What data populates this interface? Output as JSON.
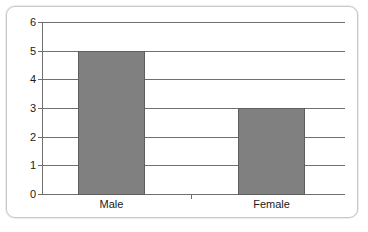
{
  "chart_data": {
    "type": "bar",
    "title": "",
    "subtitle": "",
    "xlabel": "",
    "ylabel": "",
    "categories": [
      "Male",
      "Female"
    ],
    "values": [
      5,
      3
    ],
    "series": [
      {
        "name": "",
        "values": [
          5,
          3
        ]
      }
    ],
    "ylim": [
      0,
      6
    ],
    "ytick_labels": [
      "0",
      "1",
      "2",
      "3",
      "4",
      "5",
      "6"
    ],
    "ytick_values": [
      0,
      1,
      2,
      3,
      4,
      5,
      6
    ],
    "grid": true,
    "legend": false,
    "legend_position": "none",
    "annotations": [],
    "colors": {
      "bar_fill": "#808080",
      "bar_edge": "#5e5e5e",
      "grid": "#6f6f6f",
      "axis": "#6f6f6f",
      "text": "#1a1a1a",
      "frame_border": "#c9c9c9",
      "background": "#ffffff"
    }
  }
}
